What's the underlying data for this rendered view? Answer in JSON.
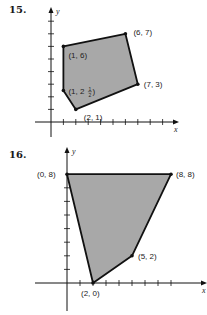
{
  "problems": [
    {
      "number": "15.",
      "axis_x_label": "x",
      "axis_y_label": "y",
      "shape": "polygon",
      "vertices": [
        {
          "x": 1,
          "y": 6,
          "label": "(1, 6)"
        },
        {
          "x": 6,
          "y": 7,
          "label": "(6, 7)"
        },
        {
          "x": 7,
          "y": 3,
          "label": "(7, 3)"
        },
        {
          "x": 2,
          "y": 1,
          "label": "(2, 1)"
        },
        {
          "x": 1,
          "y": 2.5,
          "label": "(1, 2½)"
        }
      ],
      "x_ticks": [
        1,
        2,
        3,
        4,
        5,
        6,
        7,
        8,
        9
      ],
      "y_ticks": [
        1,
        2,
        3,
        4,
        5,
        6,
        7,
        8
      ],
      "fill_color": "#a8a8a8",
      "edge_color": "#111111"
    },
    {
      "number": "16.",
      "axis_x_label": "x",
      "axis_y_label": "y",
      "shape": "polygon",
      "vertices": [
        {
          "x": 0,
          "y": 8,
          "label": "(0, 8)"
        },
        {
          "x": 8,
          "y": 8,
          "label": "(8, 8)"
        },
        {
          "x": 5,
          "y": 2,
          "label": "(5, 2)"
        },
        {
          "x": 2,
          "y": 0,
          "label": "(2, 0)"
        }
      ],
      "x_ticks": [
        1,
        2,
        3,
        4,
        5,
        6,
        7,
        8
      ],
      "y_ticks": [
        1,
        2,
        3,
        4,
        5,
        6,
        7
      ],
      "fill_color": "#a8a8a8",
      "edge_color": "#111111"
    }
  ]
}
